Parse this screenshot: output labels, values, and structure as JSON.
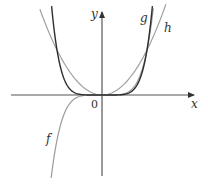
{
  "diagram": {
    "axes": {
      "x_label": "x",
      "y_label": "y",
      "origin_label": "0",
      "origin_px": [
        102,
        95
      ],
      "unit_px": 45,
      "x_range_px": [
        11,
        194
      ],
      "y_range_px": [
        12,
        176
      ],
      "color": "#555555"
    },
    "curves": [
      {
        "name": "f",
        "label": "f",
        "expr": "x^5",
        "power": 5,
        "color": "#9a9a9a",
        "x_range": [
          -1.13,
          1.14
        ],
        "label_px": [
          46,
          143
        ]
      },
      {
        "name": "g",
        "label": "g",
        "expr": "x^6",
        "power": 6,
        "color": "#2e2e2e",
        "x_range": [
          -1.12,
          1.12
        ],
        "label_px": [
          140,
          22
        ]
      },
      {
        "name": "h",
        "label": "h",
        "expr": "x^2",
        "power": 2,
        "color": "#a0a0a0",
        "x_range": [
          -1.38,
          1.42
        ],
        "label_px": [
          164,
          32
        ]
      }
    ]
  },
  "chart_data": {
    "type": "line",
    "title": "",
    "xlabel": "x",
    "ylabel": "y",
    "series": [
      {
        "name": "f",
        "function": "x^5"
      },
      {
        "name": "g",
        "function": "x^6"
      },
      {
        "name": "h",
        "function": "x^2"
      }
    ],
    "annotations": [
      "0 at origin",
      "curves g and h intersect at (-1,1) and (1,1)"
    ],
    "grid": false,
    "legend": "inline labels"
  }
}
